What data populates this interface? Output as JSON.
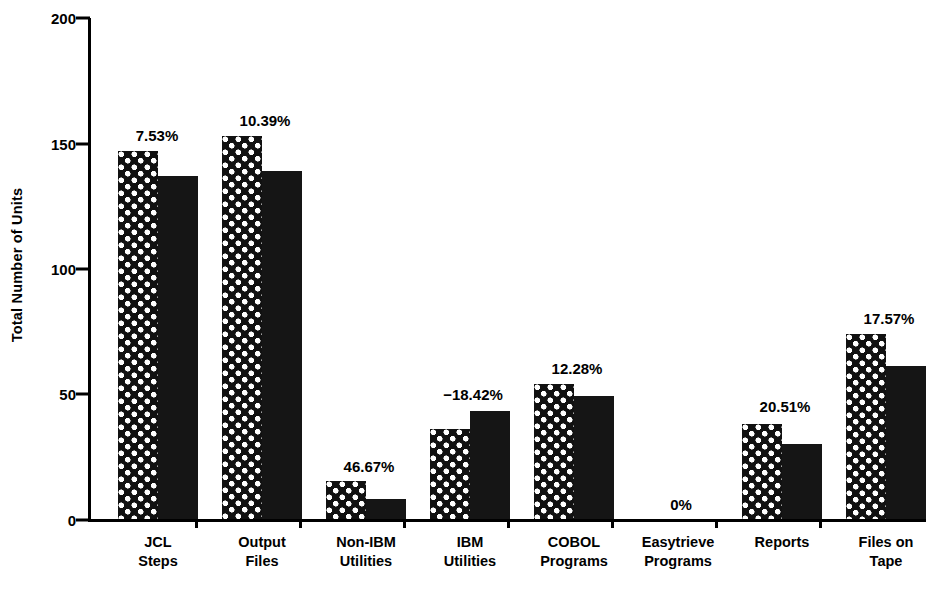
{
  "chart_data": {
    "type": "bar",
    "title": "",
    "subtitle": "",
    "xlabel": "",
    "ylabel": "Total Number of Units",
    "ylim": [
      0,
      200
    ],
    "yticks": [
      0,
      50,
      100,
      150,
      200
    ],
    "ytick_labels": [
      "0",
      "50",
      "100",
      "150",
      "200"
    ],
    "grid": false,
    "legend": "none",
    "categories": [
      "JCL\nSteps",
      "Output\nFiles",
      "Non-IBM\nUtilities",
      "IBM\nUtilities",
      "COBOL\nPrograms",
      "Easytrieve\nPrograms",
      "Reports",
      "Files on\nTape"
    ],
    "series": [
      {
        "name": "Before",
        "pattern": "checkered-dots",
        "values": [
          147,
          153,
          15,
          36,
          54,
          0,
          38,
          74
        ]
      },
      {
        "name": "After",
        "pattern": "solid-black",
        "values": [
          137,
          139,
          8,
          43,
          49,
          0,
          30,
          61
        ]
      }
    ],
    "annotations": [
      "7.53%",
      "10.39%",
      "46.67%",
      "−18.42%",
      "12.28%",
      "0%",
      "20.51%",
      "17.57%"
    ]
  },
  "axes": {
    "y_title": "Total Number of Units",
    "y_tick_labels": {
      "t200": "200",
      "t150": "150",
      "t100": "100",
      "t50": "50",
      "t0": "0"
    }
  },
  "categories": {
    "c0_l1": "JCL",
    "c0_l2": "Steps",
    "c1_l1": "Output",
    "c1_l2": "Files",
    "c2_l1": "Non-IBM",
    "c2_l2": "Utilities",
    "c3_l1": "IBM",
    "c3_l2": "Utilities",
    "c4_l1": "COBOL",
    "c4_l2": "Programs",
    "c5_l1": "Easytrieve",
    "c5_l2": "Programs",
    "c6_l1": "Reports",
    "c6_l2": "",
    "c7_l1": "Files on",
    "c7_l2": "Tape"
  },
  "annotations": {
    "a0": "7.53%",
    "a1": "10.39%",
    "a2": "46.67%",
    "a3": "−18.42%",
    "a4": "12.28%",
    "a5": "0%",
    "a6": "20.51%",
    "a7": "17.57%"
  },
  "colors": {
    "ink": "#000000",
    "background": "#ffffff",
    "bar_fill": "#111111",
    "pattern_dot": "#ffffff"
  }
}
